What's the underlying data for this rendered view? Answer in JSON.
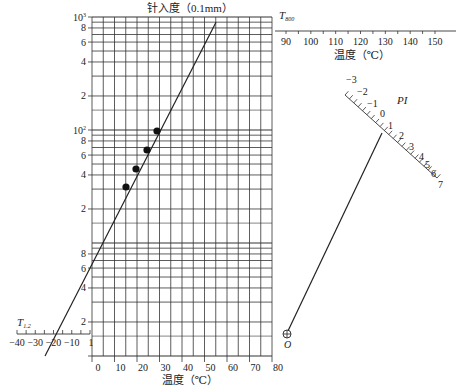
{
  "chart_data": {
    "type": "nomograph",
    "title": "针入度（0.1mm）",
    "xlabel": "温度（℃）",
    "ylabel": "针入度（0.1mm）",
    "y_scale": "log",
    "ylim": [
      1,
      1000
    ],
    "xlim": [
      0,
      80
    ],
    "y_ticks": [
      {
        "label": "10³",
        "value": 1000
      },
      {
        "label": "8",
        "value": 800
      },
      {
        "label": "6",
        "value": 600
      },
      {
        "label": "4",
        "value": 400
      },
      {
        "label": "2",
        "value": 200
      },
      {
        "label": "10²",
        "value": 100
      },
      {
        "label": "8",
        "value": 80
      },
      {
        "label": "6",
        "value": 60
      },
      {
        "label": "4",
        "value": 40
      },
      {
        "label": "2",
        "value": 20
      },
      {
        "label": "8",
        "value": 8
      },
      {
        "label": "6",
        "value": 6
      },
      {
        "label": "4",
        "value": 4
      },
      {
        "label": "2",
        "value": 2
      },
      {
        "label": "1",
        "value": 1
      }
    ],
    "x_ticks": [
      "0",
      "10",
      "20",
      "30",
      "40",
      "50",
      "60",
      "70",
      "80"
    ],
    "data_points": [
      {
        "x": 15,
        "y": 27
      },
      {
        "x": 20,
        "y": 41
      },
      {
        "x": 25,
        "y": 62
      },
      {
        "x": 30,
        "y": 95
      }
    ],
    "regression_line": {
      "from": {
        "x": -26,
        "y": 1
      },
      "to": {
        "x": 55,
        "y": 900
      }
    },
    "t12_scale": {
      "label": "T",
      "subscript": "1.2",
      "ticks": [
        "-40",
        "-30",
        "-20",
        "-10"
      ],
      "range": [
        -40,
        0
      ]
    },
    "t800_scale": {
      "label": "T",
      "subscript": "800",
      "ticks": [
        "90",
        "100",
        "110",
        "120",
        "130",
        "140",
        "150"
      ],
      "xlabel": "温度（℃）"
    },
    "pi_scale": {
      "label": "PI",
      "ticks": [
        "-3",
        "-2",
        "-1",
        "0",
        "1",
        "2",
        "3",
        "4",
        "5",
        "6",
        "7"
      ]
    },
    "origin_point": {
      "label": "O"
    }
  },
  "labels": {
    "title": "针入度（0.1mm）",
    "xlabel": "温度（℃）",
    "t800_xlabel": "温度（℃）",
    "pi": "PI",
    "origin": "O",
    "t12": "T",
    "t12_sub": "1.2",
    "t800": "T",
    "t800_sub": "800"
  }
}
